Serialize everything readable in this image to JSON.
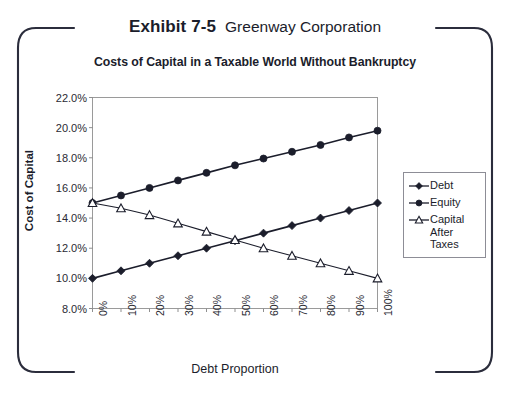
{
  "exhibit": {
    "label": "Exhibit 7-5",
    "company": "Greenway Corporation"
  },
  "chart_title": "Costs of Capital in a Taxable World Without Bankruptcy",
  "axis": {
    "y_title": "Cost of Capital",
    "x_title": "Debt Proportion"
  },
  "legend": {
    "items": [
      {
        "label": "Debt",
        "marker": "filled-diamond-marker",
        "color": "#1b1d2b"
      },
      {
        "label": "Equity",
        "marker": "filled-circle-marker",
        "color": "#1b1d2b"
      },
      {
        "label": "Capital After Taxes",
        "marker": "open-triangle-marker",
        "color": "#1b1d2b"
      }
    ]
  },
  "chart_data": {
    "type": "line",
    "title": "Costs of Capital in a Taxable World Without Bankruptcy",
    "xlabel": "Debt Proportion",
    "ylabel": "Cost of Capital",
    "categories": [
      "0%",
      "10%",
      "20%",
      "30%",
      "40%",
      "50%",
      "60%",
      "70%",
      "80%",
      "90%",
      "100%"
    ],
    "x": [
      0,
      10,
      20,
      30,
      40,
      50,
      60,
      70,
      80,
      90,
      100
    ],
    "xlim": [
      0,
      100
    ],
    "ylim": [
      8.0,
      22.0
    ],
    "ytick_labels": [
      "22.0%",
      "20.0%",
      "18.0%",
      "16.0%",
      "14.0%",
      "12.0%",
      "10.0%",
      "8.0%"
    ],
    "ytick_values": [
      22.0,
      20.0,
      18.0,
      16.0,
      14.0,
      12.0,
      10.0,
      8.0
    ],
    "grid": false,
    "legend_position": "right",
    "series": [
      {
        "name": "Debt",
        "marker": "filled-diamond-marker",
        "color": "#1b1d2b",
        "values": [
          10.0,
          10.5,
          11.0,
          11.5,
          12.0,
          12.5,
          13.0,
          13.5,
          14.0,
          14.5,
          15.0
        ]
      },
      {
        "name": "Equity",
        "marker": "filled-circle-marker",
        "color": "#1b1d2b",
        "values": [
          15.0,
          15.5,
          16.0,
          16.5,
          17.0,
          17.5,
          17.95,
          18.4,
          18.85,
          19.35,
          19.8
        ]
      },
      {
        "name": "Capital After Taxes",
        "marker": "open-triangle-marker",
        "color": "#1b1d2b",
        "values": [
          15.0,
          14.65,
          14.2,
          13.65,
          13.1,
          12.55,
          12.0,
          11.5,
          11.0,
          10.5,
          10.0
        ]
      }
    ]
  }
}
